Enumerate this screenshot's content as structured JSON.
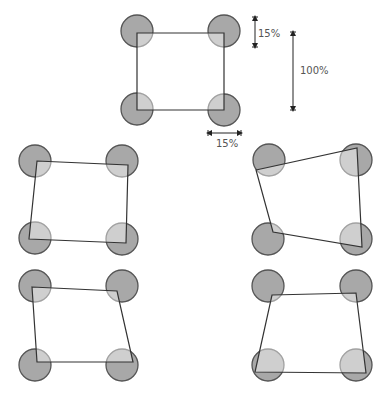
{
  "diagram": {
    "circle_radius": 16,
    "colors": {
      "circle_fill": "#a8a8a8",
      "circle_stroke": "#555555",
      "quad_stroke": "#333333",
      "label": "#555555"
    },
    "reference": {
      "circles": [
        [
          137,
          31
        ],
        [
          224,
          31
        ],
        [
          137,
          109
        ],
        [
          224,
          110
        ]
      ],
      "quad": [
        [
          137,
          33
        ],
        [
          224,
          33
        ],
        [
          224,
          110
        ],
        [
          137,
          110
        ]
      ]
    },
    "annotations": {
      "corner_size_vertical": {
        "label": "15%",
        "x": 255,
        "y1": 17,
        "y2": 47,
        "label_x": 258,
        "label_y": 37
      },
      "full_size": {
        "label": "100%",
        "x": 293,
        "y1": 32,
        "y2": 110,
        "label_x": 300,
        "label_y": 74
      },
      "corner_size_horizontal": {
        "label": "15%",
        "y": 133,
        "x1": 208,
        "x2": 241,
        "label_x": 216,
        "label_y": 147
      }
    },
    "variants": [
      {
        "name": "variant-middle-left",
        "circles": [
          [
            35,
            161
          ],
          [
            122,
            161
          ],
          [
            35,
            238
          ],
          [
            122,
            239
          ]
        ],
        "quad": [
          [
            37,
            161
          ],
          [
            128,
            165
          ],
          [
            126,
            243
          ],
          [
            29,
            239
          ]
        ]
      },
      {
        "name": "variant-middle-right",
        "circles": [
          [
            269,
            160
          ],
          [
            356,
            160
          ],
          [
            268,
            239
          ],
          [
            356,
            239
          ]
        ],
        "quad": [
          [
            256,
            170
          ],
          [
            357,
            148
          ],
          [
            362,
            247
          ],
          [
            273,
            232
          ]
        ]
      },
      {
        "name": "variant-bottom-left",
        "circles": [
          [
            35,
            286
          ],
          [
            122,
            286
          ],
          [
            35,
            365
          ],
          [
            122,
            365
          ]
        ],
        "quad": [
          [
            32,
            287
          ],
          [
            117,
            291
          ],
          [
            133,
            362
          ],
          [
            37,
            362
          ]
        ]
      },
      {
        "name": "variant-bottom-right",
        "circles": [
          [
            268,
            286
          ],
          [
            356,
            286
          ],
          [
            268,
            365
          ],
          [
            356,
            365
          ]
        ],
        "quad": [
          [
            272,
            295
          ],
          [
            356,
            293
          ],
          [
            366,
            373
          ],
          [
            255,
            372
          ]
        ]
      }
    ]
  }
}
